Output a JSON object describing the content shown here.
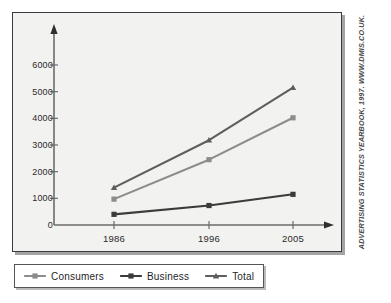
{
  "chart_data": {
    "type": "line",
    "title": "",
    "xlabel": "",
    "ylabel": "",
    "categories": [
      "1986",
      "1996",
      "2005"
    ],
    "x": [
      1986,
      1996,
      2005
    ],
    "ylim": [
      0,
      6600
    ],
    "yticks": [
      0,
      1000,
      2000,
      3000,
      4000,
      5000,
      6000
    ],
    "ytick_labels": [
      "0",
      "1000",
      "2000",
      "3000",
      "4000",
      "5000",
      "6000"
    ],
    "grid": false,
    "legend_position": "bottom-left",
    "series": [
      {
        "name": "Consumers",
        "values": [
          970,
          2450,
          4020
        ],
        "color": "#8c8c8c",
        "marker": "square"
      },
      {
        "name": "Business",
        "values": [
          400,
          730,
          1150
        ],
        "color": "#3b3b3b",
        "marker": "square"
      },
      {
        "name": "Total",
        "values": [
          1400,
          3180,
          5150
        ],
        "color": "#5e5e5e",
        "marker": "triangle"
      }
    ]
  },
  "legend": {
    "items": [
      {
        "label": "Consumers"
      },
      {
        "label": "Business"
      },
      {
        "label": "Total"
      }
    ]
  },
  "source": {
    "credit": "ADVERTISING STATISTICS YEARBOOK, 1997. WWW.DMIS.CO.UK."
  },
  "colors": {
    "panel_background": "#f2f2f0",
    "panel_border": "#3a3a3a",
    "axis": "#6b6b6b",
    "text": "#2b2b2b"
  }
}
